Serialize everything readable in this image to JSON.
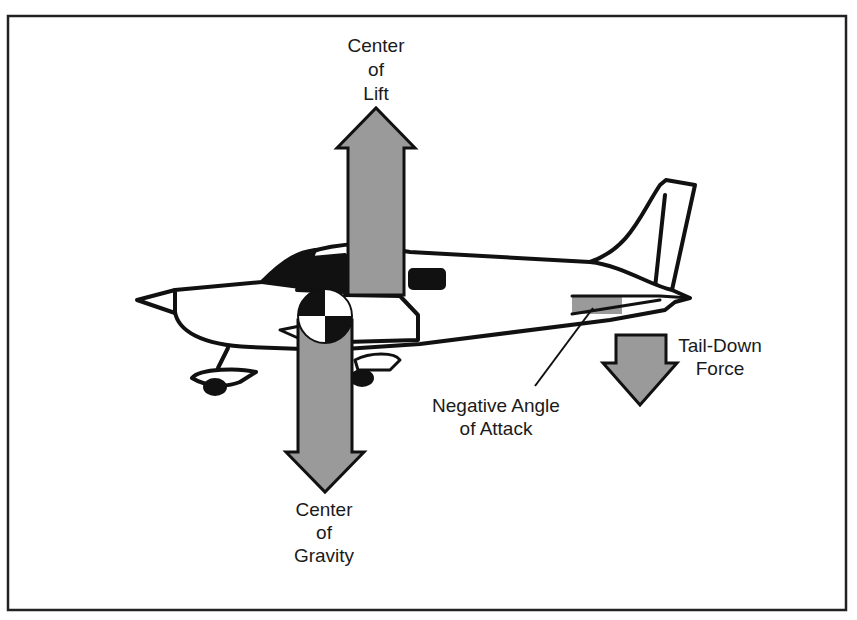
{
  "diagram": {
    "labels": {
      "center_of_lift": [
        "Center",
        "of",
        "Lift"
      ],
      "center_of_gravity": [
        "Center",
        "of",
        "Gravity"
      ],
      "tail_down_force": [
        "Tail-Down",
        "Force"
      ],
      "negative_angle_of_attack": [
        "Negative Angle",
        "of Attack"
      ]
    },
    "colors": {
      "arrow_fill": "#9a9a9a",
      "outline": "#111111",
      "background": "#ffffff"
    }
  }
}
